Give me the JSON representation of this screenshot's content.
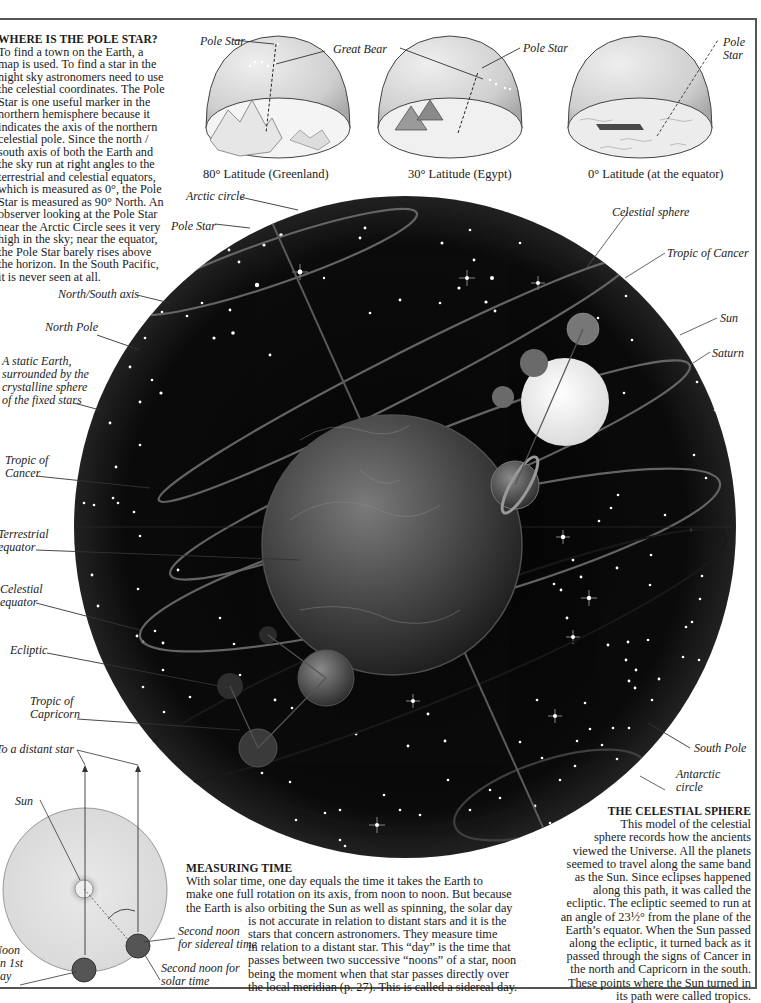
{
  "sidebar": {
    "heading": "WHERE IS THE POLE STAR?",
    "body": "To find a town on the Earth, a map is used. To find a star in the night sky astronomers need to use the celestial coordinates. The Pole Star is one useful marker in the northern hemisphere because it indicates the axis of the northern celestial pole. Since the north / south axis of both the Earth and the sky run at right angles to the terrestrial and celestial equators, which is measured as 0°, the Pole Star is measured as 90° North. An observer looking at the Pole Star near the Arctic Circle sees it very high in the sky; near the equator, the Pole Star barely rises above the horizon. In the South Pacific, it is never seen at all."
  },
  "domes": [
    {
      "caption": "80° Latitude (Greenland)",
      "labels": [
        "Pole Star",
        "Great Bear"
      ]
    },
    {
      "caption": "30° Latitude (Egypt)",
      "labels": [
        "Pole Star"
      ]
    },
    {
      "caption": "0° Latitude (at the equator)",
      "labels": [
        "Pole",
        "Star"
      ]
    }
  ],
  "sphere_labels": {
    "left": {
      "arctic_circle": "Arctic circle",
      "pole_star": "Pole Star",
      "north_south_axis": "North/South axis",
      "north_pole": "North Pole",
      "static_earth": [
        "A static Earth,",
        "surrounded by the",
        "crystalline sphere",
        "of the fixed stars"
      ],
      "tropic_cancer": [
        "Tropic of",
        "Cancer"
      ],
      "terrestrial_equator": [
        "Terrestrial",
        "equator"
      ],
      "celestial_equator": [
        "Celestial",
        "equator"
      ],
      "ecliptic": "Ecliptic",
      "tropic_capricorn": [
        "Tropic of",
        "Capricorn"
      ]
    },
    "right": {
      "celestial_sphere": "Celestial sphere",
      "tropic_cancer": "Tropic of Cancer",
      "sun": "Sun",
      "saturn": "Saturn",
      "south_pole": "South Pole",
      "antarctic_circle": [
        "Antarctic",
        "circle"
      ]
    }
  },
  "time_diagram": {
    "distant_star": "To a distant star",
    "sun": "Sun",
    "noon_first_day": [
      "Noon",
      "on 1st",
      "day"
    ],
    "second_noon_sidereal": [
      "Second noon",
      "for sidereal time"
    ],
    "second_noon_solar": [
      "Second noon for",
      "solar time"
    ]
  },
  "measuring_time": {
    "heading": "MEASURING TIME",
    "lines": [
      "With solar time, one day equals the time it takes the Earth to",
      "make one full rotation on its axis, from noon to noon. But because",
      "the Earth is also orbiting the Sun as well as spinning, the solar day",
      "is not accurate in relation to distant stars and it is the",
      "stars that concern astronomers. They measure time",
      "in relation to a distant star. This “day” is the time that",
      "passes between two successive “noons” of a star, noon",
      "being the moment when that star passes directly over",
      "the local meridian (p. 27). This is called a sidereal day."
    ]
  },
  "celestial_sphere_text": {
    "heading": "THE CELESTIAL SPHERE",
    "lines": [
      "This model of the celestial",
      "sphere records how the ancients",
      "viewed the Universe. All the planets",
      "seemed to travel along the same band",
      "as the Sun. Since eclipses happened",
      "along this path, it was called the",
      "ecliptic. The ecliptic seemed to run at",
      "an angle of 23½° from the plane of the",
      "Earth’s equator. When the Sun passed",
      "along the ecliptic, it turned back as it",
      "passed through the signs of Cancer in",
      "the north and Capricorn in the south.",
      "These points where the Sun turned in",
      "its path were called tropics."
    ]
  },
  "colors": {
    "sky": "#0a0a0a",
    "frame": "#555555",
    "dome": "#d8d8d8",
    "text": "#1a1a1a"
  }
}
